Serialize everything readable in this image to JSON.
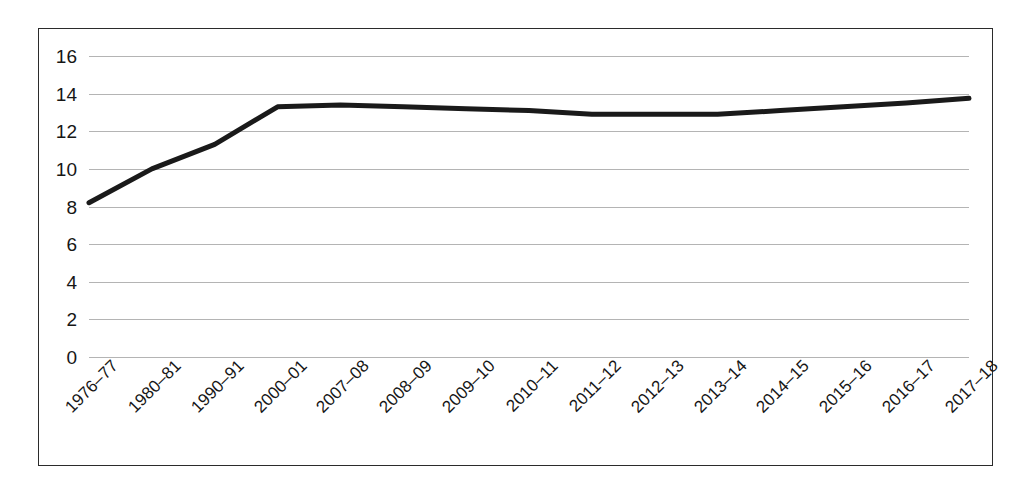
{
  "chart_data": {
    "type": "line",
    "title": "",
    "subtitle": "",
    "xlabel": "",
    "ylabel": "",
    "categories": [
      "1976–77",
      "1980–81",
      "1990–91",
      "2000–01",
      "2007–08",
      "2008–09",
      "2009–10",
      "2010–11",
      "2011–12",
      "2012–13",
      "2013–14",
      "2014–15",
      "2015–16",
      "2016–17",
      "2017–18"
    ],
    "series": [
      {
        "name": "series-1",
        "values": [
          8.2,
          10.0,
          11.3,
          13.3,
          13.4,
          13.3,
          13.2,
          13.1,
          12.9,
          12.9,
          12.9,
          13.1,
          13.3,
          13.5,
          13.75
        ]
      }
    ],
    "ylim": [
      0,
      16
    ],
    "xlim_index": [
      0,
      14
    ],
    "yticks": [
      0,
      2,
      4,
      6,
      8,
      10,
      12,
      14,
      16
    ],
    "ytick_labels": [
      "0",
      "2",
      "4",
      "6",
      "8",
      "10",
      "12",
      "14",
      "16"
    ],
    "grid": "horizontal",
    "legend": "none",
    "line_color": "#1a1a1a",
    "line_width_px": 5,
    "gridline_color": "#b4b4b4",
    "background_color": "#ffffff",
    "frame_color": "#2b2b2b",
    "xtick_label_rotation_deg": -45
  }
}
